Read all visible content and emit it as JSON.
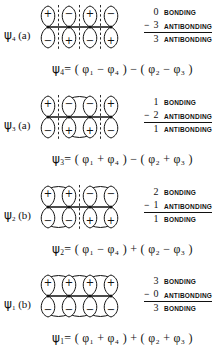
{
  "figure": {
    "rows": [
      {
        "label_psi": "ψ",
        "label_sub": "4",
        "label_symmetry": "(a)",
        "top_signs": [
          "+",
          "−",
          "+",
          "−"
        ],
        "bottom_signs": [
          "−",
          "+",
          "−",
          "+"
        ],
        "nodes": [
          1,
          2,
          3
        ],
        "bond_arcs": [],
        "tally": [
          {
            "op": "",
            "num": "0",
            "word": "BONDING",
            "ruled": false
          },
          {
            "op": "−",
            "num": "3",
            "word": "ANTIBONDING",
            "ruled": true
          },
          {
            "op": "",
            "num": "3",
            "word": "ANTIBONDING",
            "ruled": false
          }
        ],
        "equation": {
          "lhs_sym": "ψ",
          "lhs_sub": "4",
          "text": "= ( φ₁ − φ₄ ) − ( φ₂ − φ₃ )",
          "terms": [
            {
              "sign": "",
              "phi_sub": "1"
            },
            {
              "sign": "−",
              "phi_sub": "4"
            },
            {
              "group_op": "−"
            },
            {
              "sign": "",
              "phi_sub": "2"
            },
            {
              "sign": "−",
              "phi_sub": "3"
            }
          ]
        }
      },
      {
        "label_psi": "ψ",
        "label_sub": "3",
        "label_symmetry": "(a)",
        "top_signs": [
          "+",
          "−",
          "−",
          "+"
        ],
        "bottom_signs": [
          "−",
          "+",
          "+",
          "−"
        ],
        "nodes": [
          1,
          3
        ],
        "bond_arcs": [
          2
        ],
        "tally": [
          {
            "op": "",
            "num": "1",
            "word": "BONDING",
            "ruled": false
          },
          {
            "op": "−",
            "num": "2",
            "word": "ANTIBONDING",
            "ruled": true
          },
          {
            "op": "",
            "num": "1",
            "word": "ANTIBONDING",
            "ruled": false
          }
        ],
        "equation": {
          "lhs_sym": "ψ",
          "lhs_sub": "3",
          "text": "= ( φ₁ + φ₄ ) − ( φ₂ + φ₃ )",
          "terms": [
            {
              "sign": "",
              "phi_sub": "1"
            },
            {
              "sign": "+",
              "phi_sub": "4"
            },
            {
              "group_op": "−"
            },
            {
              "sign": "",
              "phi_sub": "2"
            },
            {
              "sign": "+",
              "phi_sub": "3"
            }
          ]
        }
      },
      {
        "label_psi": "ψ",
        "label_sub": "2",
        "label_symmetry": "(b)",
        "top_signs": [
          "+",
          "+",
          "−",
          "−"
        ],
        "bottom_signs": [
          "−",
          "−",
          "+",
          "+"
        ],
        "nodes": [
          2
        ],
        "bond_arcs": [
          1,
          3
        ],
        "tally": [
          {
            "op": "",
            "num": "2",
            "word": "BONDING",
            "ruled": false
          },
          {
            "op": "−",
            "num": "1",
            "word": "ANTIBONDING",
            "ruled": true
          },
          {
            "op": "",
            "num": "1",
            "word": "BONDING",
            "ruled": false
          }
        ],
        "equation": {
          "lhs_sym": "ψ",
          "lhs_sub": "2",
          "text": "= ( φ₁ − φ₄ ) + ( φ₂ − φ₃ )",
          "terms": [
            {
              "sign": "",
              "phi_sub": "1"
            },
            {
              "sign": "−",
              "phi_sub": "4"
            },
            {
              "group_op": "+"
            },
            {
              "sign": "",
              "phi_sub": "2"
            },
            {
              "sign": "−",
              "phi_sub": "3"
            }
          ]
        }
      },
      {
        "label_psi": "ψ",
        "label_sub": "1",
        "label_symmetry": "(b)",
        "top_signs": [
          "+",
          "+",
          "+",
          "+"
        ],
        "bottom_signs": [
          "−",
          "−",
          "−",
          "−"
        ],
        "nodes": [],
        "bond_arcs": [
          1,
          2,
          3
        ],
        "tally": [
          {
            "op": "",
            "num": "3",
            "word": "BONDING",
            "ruled": false
          },
          {
            "op": "−",
            "num": "0",
            "word": "ANTIBONDING",
            "ruled": true
          },
          {
            "op": "",
            "num": "3",
            "word": "BONDING",
            "ruled": false
          }
        ],
        "equation": {
          "lhs_sym": "ψ",
          "lhs_sub": "1",
          "text": "= ( φ₁ + φ₄ ) + ( φ₂ + φ₃ )",
          "terms": [
            {
              "sign": "",
              "phi_sub": "1"
            },
            {
              "sign": "+",
              "phi_sub": "4"
            },
            {
              "group_op": "+"
            },
            {
              "sign": "",
              "phi_sub": "2"
            },
            {
              "sign": "+",
              "phi_sub": "3"
            }
          ]
        }
      }
    ]
  },
  "colors": {
    "ink": "#111111",
    "background": "#ffffff"
  }
}
